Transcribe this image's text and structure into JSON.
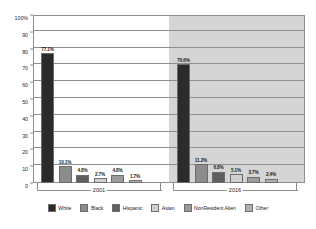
{
  "chart_data": {
    "type": "bar",
    "title": "",
    "subtitle": "",
    "xlabel": "",
    "ylabel": "",
    "ylim": [
      0,
      100
    ],
    "grid": true,
    "legend_position": "bottom",
    "categories": [
      "2001",
      "2016"
    ],
    "y_ticks": [
      "0",
      "10",
      "20",
      "30",
      "40",
      "50",
      "60",
      "70",
      "80",
      "90",
      "100%"
    ],
    "y_tick_values": [
      0,
      10,
      20,
      30,
      40,
      50,
      60,
      70,
      80,
      90,
      100
    ],
    "series": [
      {
        "name": "White",
        "color": "#2b2b2b",
        "values": [
          77.1,
          70.6
        ],
        "labels": [
          "77.1%",
          "70.6%"
        ]
      },
      {
        "name": "Black",
        "color": "#8c8c8c",
        "values": [
          10.1,
          11.2
        ],
        "labels": [
          "10.1%",
          "11.2%"
        ]
      },
      {
        "name": "Hispanic",
        "color": "#5e5e5e",
        "values": [
          4.8,
          6.8
        ],
        "labels": [
          "4.8%",
          "6.8%"
        ]
      },
      {
        "name": "Asian",
        "color": "#d0d0d0",
        "values": [
          2.7,
          5.1
        ],
        "labels": [
          "2.7%",
          "5.1%"
        ]
      },
      {
        "name": "NonResident Alien",
        "color": "#9a9a9a",
        "values": [
          4.8,
          3.7
        ],
        "labels": [
          "4.8%",
          "3.7%"
        ]
      },
      {
        "name": "Other",
        "color": "#b0b0b0",
        "values": [
          1.7,
          2.4
        ],
        "labels": [
          "1.7%",
          "2.4%"
        ]
      }
    ]
  },
  "axis": {
    "y_tick_0": "0",
    "y_tick_1": "10",
    "y_tick_2": "20",
    "y_tick_3": "30",
    "y_tick_4": "40",
    "y_tick_5": "50",
    "y_tick_6": "60",
    "y_tick_7": "70",
    "y_tick_8": "80",
    "y_tick_9": "90",
    "y_tick_10": "100%"
  },
  "groups": {
    "label_2001": "2001",
    "label_2016": "2016"
  },
  "legend": {
    "items": [
      {
        "label": "White",
        "color": "#2b2b2b"
      },
      {
        "label": "Black",
        "color": "#8c8c8c"
      },
      {
        "label": "Hispanic",
        "color": "#5e5e5e"
      },
      {
        "label": "Asian",
        "color": "#d0d0d0"
      },
      {
        "label": "NonResident Alien",
        "color": "#9a9a9a"
      },
      {
        "label": "Other",
        "color": "#b0b0b0"
      }
    ]
  },
  "colors": {
    "frame": "#8e8e8e",
    "gridline": "#8e8e8e",
    "panel_shade_2016": "#d5d5d5",
    "plot_background": "#ffffff",
    "text": "#1f1f1f"
  }
}
